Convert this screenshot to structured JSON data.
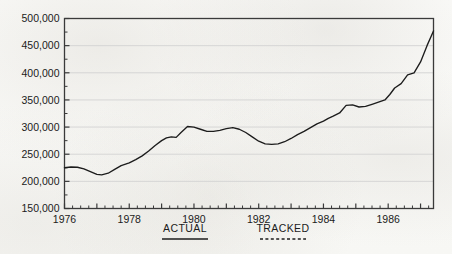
{
  "chart_data": {
    "type": "line",
    "title": "",
    "subtitle": "",
    "xlabel": "",
    "ylabel": "",
    "xlim": [
      1976,
      1987.4
    ],
    "ylim": [
      150000,
      500000
    ],
    "grid": true,
    "grid_axis": "y",
    "legend_position": "below-plot",
    "y_ticks": [
      150000,
      200000,
      250000,
      300000,
      350000,
      400000,
      450000,
      500000
    ],
    "y_tick_labels": [
      "150,000",
      "200,000",
      "250,000",
      "300,000",
      "350,000",
      "400,000",
      "450,000",
      "500,000"
    ],
    "x_ticks": [
      1976,
      1978,
      1980,
      1982,
      1984,
      1986
    ],
    "x_tick_labels": [
      "1976",
      "1978",
      "1980",
      "1982",
      "1984",
      "1986"
    ],
    "x_minor_tick_interval": 0.25,
    "legend": [
      {
        "name": "ACTUAL",
        "style": "solid",
        "color": "#1c1c1c"
      },
      {
        "name": "TRACKED",
        "style": "dashed",
        "color": "#1c1c1c"
      }
    ],
    "series": [
      {
        "name": "ACTUAL",
        "style": "solid",
        "color": "#1c1c1c",
        "x": [
          1976.0,
          1976.25,
          1976.5,
          1976.75,
          1977.0,
          1977.25,
          1977.5,
          1977.75,
          1978.0,
          1978.25,
          1978.5,
          1978.75,
          1979.0,
          1979.25,
          1979.5,
          1979.75,
          1980.0,
          1980.25,
          1980.5,
          1980.75,
          1981.0,
          1981.25,
          1981.5,
          1981.75,
          1982.0,
          1982.25,
          1982.5,
          1982.75,
          1983.0,
          1983.25,
          1983.5,
          1983.75,
          1984.0,
          1984.25,
          1984.5,
          1984.75,
          1985.0,
          1985.25,
          1985.5,
          1985.75,
          1986.0,
          1986.25,
          1986.5,
          1986.75,
          1987.0,
          1987.25
        ],
        "y": [
          225000,
          227000,
          226000,
          221000,
          214000,
          212000,
          218000,
          226000,
          232000,
          238000,
          247000,
          258000,
          268000,
          277000,
          281000,
          279000,
          288000,
          301000,
          300000,
          294000,
          292000,
          294000,
          297000,
          299000,
          295000,
          286000,
          277000,
          270000,
          268000,
          271000,
          278000,
          286000,
          294000,
          305000,
          312000,
          318000,
          324000,
          340000,
          341000,
          336000,
          338000,
          345000,
          348000,
          358000,
          368000,
          373000
        ]
      },
      {
        "name": "TRACKED",
        "style": "dashed",
        "color": "#1c1c1c",
        "x": [
          1987.25,
          1987.5,
          1987.75,
          1988.0,
          1988.25,
          1988.5
        ],
        "y": [
          373000,
          382000,
          396000,
          398000,
          406000,
          416000
        ]
      }
    ],
    "combined_path": {
      "description": "Single continuous plotted curve 1976-1987.4",
      "x": [
        1976.0,
        1976.2,
        1976.4,
        1976.6,
        1976.8,
        1977.0,
        1977.15,
        1977.35,
        1977.55,
        1977.75,
        1978.0,
        1978.2,
        1978.4,
        1978.6,
        1978.8,
        1979.0,
        1979.15,
        1979.3,
        1979.45,
        1979.6,
        1979.8,
        1980.0,
        1980.2,
        1980.4,
        1980.6,
        1980.8,
        1981.0,
        1981.2,
        1981.4,
        1981.6,
        1981.8,
        1982.0,
        1982.2,
        1982.4,
        1982.6,
        1982.8,
        1983.0,
        1983.2,
        1983.4,
        1983.6,
        1983.8,
        1984.0,
        1984.15,
        1984.3,
        1984.5,
        1984.7,
        1984.9,
        1985.1,
        1985.3,
        1985.5,
        1985.7,
        1985.9,
        1986.05,
        1986.2,
        1986.4,
        1986.6,
        1986.8,
        1987.0,
        1987.2,
        1987.4
      ],
      "y": [
        225000,
        226500,
        226000,
        223000,
        218000,
        213000,
        212000,
        215000,
        222000,
        229000,
        234000,
        240000,
        247000,
        256000,
        266000,
        275000,
        280000,
        282000,
        281000,
        290000,
        301000,
        300000,
        296000,
        292000,
        292000,
        294000,
        297000,
        299000,
        296000,
        290000,
        282000,
        274000,
        269000,
        268000,
        269000,
        273000,
        279000,
        286000,
        292000,
        299000,
        306000,
        311000,
        316000,
        320000,
        326000,
        340000,
        341000,
        337000,
        338000,
        342000,
        346000,
        350000,
        360000,
        372000,
        380000,
        396000,
        400000,
        420000,
        450000,
        477000
      ]
    }
  },
  "axis": {
    "y_label_format": "comma",
    "frame_color": "#3a3a3a",
    "gridline_color": "#d2d2d2"
  }
}
